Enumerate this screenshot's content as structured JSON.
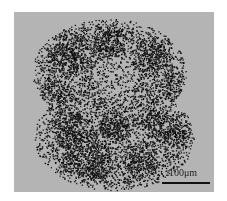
{
  "image": {
    "subject": "micrograph of dark granular cell cluster",
    "background_color": "#b4b4b4",
    "stain_color": "#0a0a0a"
  },
  "scale_bar": {
    "label": "100μm"
  }
}
